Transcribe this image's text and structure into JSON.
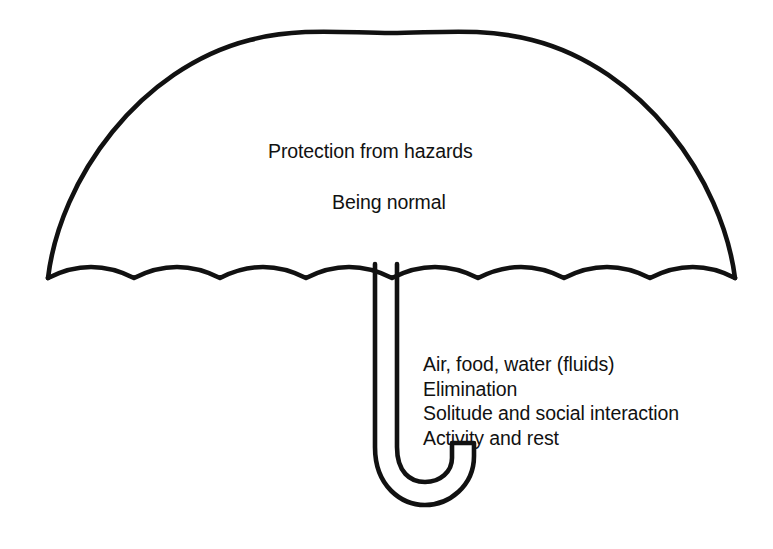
{
  "diagram": {
    "type": "umbrella-diagram",
    "stroke_color": "#111111",
    "fill_color": "#ffffff",
    "background_color": "#ffffff",
    "canopy": {
      "labels": [
        "Protection from hazards",
        "Being normal"
      ],
      "scallop_count": 8
    },
    "handle": {
      "shape": "j-hook",
      "labels": [
        "Air, food, water (fluids)",
        "Elimination",
        "Solitude and social interaction",
        "Activity and rest"
      ]
    }
  }
}
